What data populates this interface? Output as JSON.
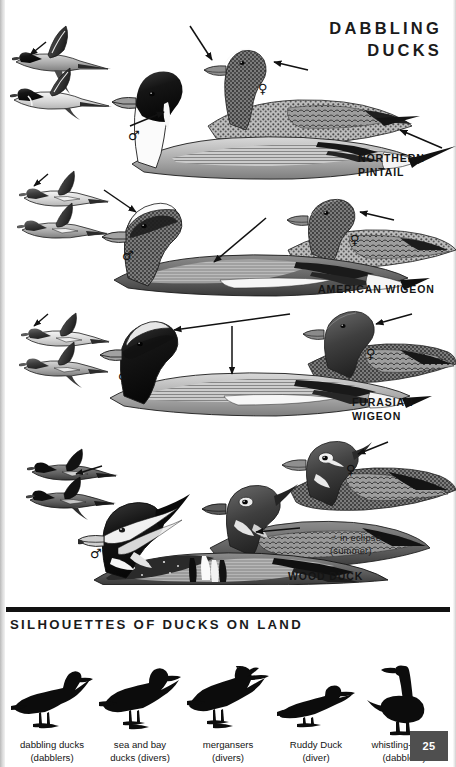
{
  "page": {
    "title": "DABBLING\nDUCKS",
    "number": "25",
    "background_color": "#ffffff",
    "ink_color": "#141414"
  },
  "species_plates": [
    {
      "name": "northern-pintail",
      "label": "NORTHERN\nPINTAIL",
      "flight_figures": 2,
      "swimming_figures": [
        {
          "sex_symbol": "♂",
          "plumage": "breeding male"
        },
        {
          "sex_symbol": "♀",
          "plumage": "female"
        }
      ],
      "pointer_arrows": 3
    },
    {
      "name": "american-wigeon",
      "label": "AMERICAN WIGEON",
      "flight_figures": 2,
      "swimming_figures": [
        {
          "sex_symbol": "♂",
          "plumage": "breeding male"
        },
        {
          "sex_symbol": "♀",
          "plumage": "female"
        }
      ],
      "pointer_arrows": 3
    },
    {
      "name": "eurasian-wigeon",
      "label": "FURASIAN\nWIGEON",
      "flight_figures": 2,
      "swimming_figures": [
        {
          "sex_symbol": "♂",
          "plumage": "breeding male"
        },
        {
          "sex_symbol": "♀",
          "plumage": "female"
        }
      ],
      "pointer_arrows": 3
    },
    {
      "name": "wood-duck",
      "label": "WOOD DUCK",
      "flight_figures": 2,
      "swimming_figures": [
        {
          "sex_symbol": "♂",
          "plumage": "breeding male"
        },
        {
          "sex_symbol": "♂",
          "plumage": "eclipse male"
        },
        {
          "sex_symbol": "♀",
          "plumage": "female"
        }
      ],
      "eclipse_note": "♂ in eclipse\n(summer)",
      "pointer_arrows": 3
    }
  ],
  "silhouettes": {
    "title": "SILHOUETTES OF DUCKS ON LAND",
    "items": [
      {
        "name": "dabbling-ducks",
        "caption": "dabbling ducks\n(dabblers)"
      },
      {
        "name": "sea-and-bay-ducks",
        "caption": "sea and bay\nducks (divers)"
      },
      {
        "name": "mergansers",
        "caption": "mergansers\n(divers)"
      },
      {
        "name": "ruddy-duck",
        "caption": "Ruddy Duck\n(diver)"
      },
      {
        "name": "whistling-ducks",
        "caption": "whistling-ducks\n(dabblers)"
      }
    ]
  },
  "sex_symbols": {
    "male": "♂",
    "female": "♀"
  }
}
